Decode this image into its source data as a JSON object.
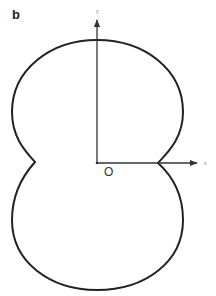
{
  "figure": {
    "panel_label": "b",
    "origin_label": "O",
    "axes": {
      "x_label": "x",
      "y_label": "y"
    },
    "curve": {
      "type": "two-lobed closed curve with cusps on the x-axis",
      "stroke_color": "#222222"
    },
    "axis_color": "#333333"
  }
}
